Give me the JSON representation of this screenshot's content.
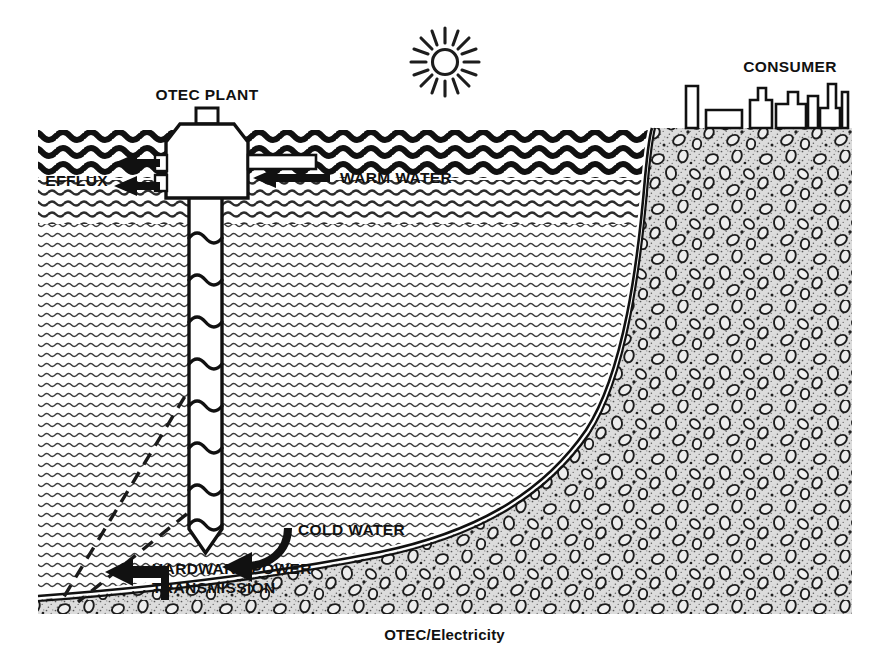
{
  "figure": {
    "caption": "OTEC/Electricity",
    "title_alt": "OTEC/Electricity",
    "labels": {
      "otec_plant": "OTEC PLANT",
      "efflux": "EFFLUX",
      "warm_water": "WARM WATER",
      "cold_water": "COLD WATER",
      "hardware_power": "HARDWARE POWER",
      "transmission": "TRANSMISSION",
      "consumer": "CONSUMER"
    },
    "icons": {
      "sun": "sun-icon",
      "plant": "otec-plant-icon",
      "skyline": "city-skyline-icon",
      "seabed": "seabed-rock-texture",
      "ocean": "ocean-water-texture"
    },
    "colors": {
      "ink": "#111111",
      "paper": "#ffffff",
      "seabed_fill": "#d2d2d2",
      "water_line": "#3a3a3a"
    },
    "geometry": {
      "frame_left": 38,
      "frame_right": 852,
      "frame_top": 128,
      "frame_bottom": 614,
      "surface_y": 130,
      "shore_x": 652
    }
  }
}
